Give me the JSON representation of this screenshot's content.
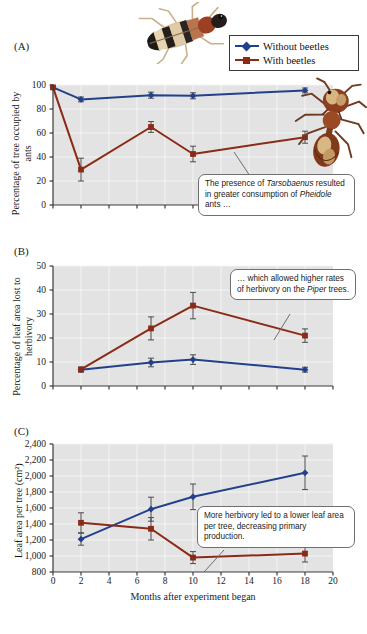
{
  "figure": {
    "panels": [
      {
        "letter": "(A)",
        "ylabel": "Percentage of tree occupied by ants",
        "ytick_labels": [
          "100",
          "80",
          "60",
          "40",
          "20",
          "0"
        ]
      },
      {
        "letter": "(B)",
        "ylabel": "Percentage of leaf area lost to herbivory",
        "ytick_labels": [
          "50",
          "40",
          "30",
          "20",
          "10",
          "0"
        ]
      },
      {
        "letter": "(C)",
        "ylabel": "Leaf area per tree (cm²)",
        "ytick_labels": [
          "2,400",
          "2,200",
          "2,000",
          "1,800",
          "1,600",
          "1,400",
          "1,200",
          "1,000",
          "800"
        ]
      }
    ],
    "xlabel": "Months after experiment began",
    "xtick_labels": [
      "0",
      "2",
      "4",
      "6",
      "8",
      "10",
      "12",
      "14",
      "16",
      "18",
      "20"
    ]
  },
  "legend": {
    "position": "top-right",
    "items": [
      {
        "label": "Without beetles",
        "color": "#23408c",
        "marker": "diamond"
      },
      {
        "label": "With beetles",
        "color": "#8b2a16",
        "marker": "square"
      }
    ]
  },
  "callouts": [
    {
      "id": "callout-a",
      "text_parts": [
        "The presence of ",
        "Tarsobaenus",
        " resulted in greater consumption of ",
        "Pheidole",
        " ants …"
      ],
      "plain_text": "The presence of Tarsobaenus resulted in greater consumption of Pheidole ants …"
    },
    {
      "id": "callout-b",
      "text_parts": [
        "… which allowed higher rates of herbivory on the ",
        "Piper",
        " trees."
      ],
      "plain_text": "… which allowed higher rates of herbivory on the Piper trees."
    },
    {
      "id": "callout-c",
      "text_parts": [
        "More herbivory led to a lower leaf area per tree, decreasing primary production."
      ],
      "plain_text": "More herbivory led to a lower leaf area per tree, decreasing primary production."
    }
  ],
  "photos": [
    {
      "id": "beetle-photo",
      "name": "tarsobaenus-beetle"
    },
    {
      "id": "ant-photo",
      "name": "pheidole-ant"
    }
  ],
  "colors": {
    "without_beetles": "#23408c",
    "with_beetles": "#8b2a16",
    "plot_background": "#e3e3e3",
    "grid": "#f4f4f4",
    "axis": "#3a3a3a"
  },
  "chart_data": [
    {
      "type": "line",
      "panel": "A",
      "title": "",
      "xlabel": "Months after experiment began",
      "ylabel": "Percentage of tree occupied by ants",
      "xlim": [
        0,
        20
      ],
      "ylim": [
        0,
        100
      ],
      "xticks": [
        0,
        2,
        4,
        6,
        8,
        10,
        12,
        14,
        16,
        18,
        20
      ],
      "yticks": [
        0,
        20,
        40,
        60,
        80,
        100
      ],
      "grid": true,
      "legend_position": "outside-top-right",
      "series": [
        {
          "name": "Without beetles",
          "color": "#23408c",
          "marker": "diamond",
          "x": [
            0,
            2,
            7,
            10,
            18
          ],
          "values": [
            98,
            88,
            91.5,
            91,
            95.5
          ],
          "error": [
            0,
            2,
            2.5,
            2.5,
            2
          ]
        },
        {
          "name": "With beetles",
          "color": "#8b2a16",
          "marker": "square",
          "x": [
            0,
            2,
            7,
            10,
            18
          ],
          "values": [
            98,
            29.5,
            65,
            42.5,
            56.5
          ],
          "error": [
            0,
            9.5,
            4.5,
            6.5,
            5
          ]
        }
      ]
    },
    {
      "type": "line",
      "panel": "B",
      "title": "",
      "xlabel": "Months after experiment began",
      "ylabel": "Percentage of leaf area lost to herbivory",
      "xlim": [
        0,
        20
      ],
      "ylim": [
        0,
        50
      ],
      "xticks": [
        0,
        2,
        4,
        6,
        8,
        10,
        12,
        14,
        16,
        18,
        20
      ],
      "yticks": [
        0,
        10,
        20,
        30,
        40,
        50
      ],
      "grid": true,
      "series": [
        {
          "name": "Without beetles",
          "color": "#23408c",
          "marker": "diamond",
          "x": [
            2,
            7,
            10,
            18
          ],
          "values": [
            6.8,
            9.8,
            11.0,
            6.8
          ],
          "error": [
            1.0,
            1.8,
            2.0,
            1.0
          ]
        },
        {
          "name": "With beetles",
          "color": "#8b2a16",
          "marker": "square",
          "x": [
            2,
            7,
            10,
            18
          ],
          "values": [
            6.9,
            24.0,
            33.5,
            21.0
          ],
          "error": [
            0.9,
            4.8,
            5.5,
            2.8
          ]
        }
      ]
    },
    {
      "type": "line",
      "panel": "C",
      "title": "",
      "xlabel": "Months after experiment began",
      "ylabel": "Leaf area per tree (cm²)",
      "xlim": [
        0,
        20
      ],
      "ylim": [
        800,
        2400
      ],
      "xticks": [
        0,
        2,
        4,
        6,
        8,
        10,
        12,
        14,
        16,
        18,
        20
      ],
      "yticks": [
        800,
        1000,
        1200,
        1400,
        1600,
        1800,
        2000,
        2200,
        2400
      ],
      "grid": true,
      "series": [
        {
          "name": "Without beetles",
          "color": "#23408c",
          "marker": "diamond",
          "x": [
            2,
            7,
            10,
            18
          ],
          "values": [
            1210,
            1585,
            1740,
            2040
          ],
          "error": [
            75,
            150,
            160,
            210
          ]
        },
        {
          "name": "With beetles",
          "color": "#8b2a16",
          "marker": "square",
          "x": [
            2,
            7,
            10,
            18
          ],
          "values": [
            1415,
            1340,
            980,
            1030
          ],
          "error": [
            125,
            140,
            75,
            105
          ]
        }
      ]
    }
  ]
}
